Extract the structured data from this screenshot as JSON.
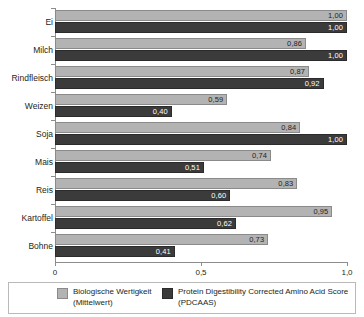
{
  "chart_data": {
    "type": "bar",
    "orientation": "horizontal",
    "title": "",
    "xlabel": "",
    "ylabel": "",
    "xlim": [
      0,
      1.0
    ],
    "grid": false,
    "legend_position": "bottom",
    "categories": [
      "Ei",
      "Milch",
      "Rindfleisch",
      "Weizen",
      "Soja",
      "Mais",
      "Reis",
      "Kartoffel",
      "Bohne"
    ],
    "xticks": [
      0,
      0.5,
      1.0
    ],
    "xtick_labels": [
      "0",
      "0,5",
      "1,0"
    ],
    "series": [
      {
        "name": "Biologische Wertigkeit (Mittelwert)",
        "color": "#b3b3b3",
        "values": [
          1.0,
          0.86,
          0.87,
          0.59,
          0.84,
          0.74,
          0.83,
          0.95,
          0.73
        ],
        "labels": [
          "1,00",
          "0,86",
          "0,87",
          "0,59",
          "0,84",
          "0,74",
          "0,83",
          "0,95",
          "0,73"
        ]
      },
      {
        "name": "Protein Digestibility Corrected Amino Acid Score (PDCAAS)",
        "color": "#3b3b3b",
        "values": [
          1.0,
          1.0,
          0.92,
          0.4,
          1.0,
          0.51,
          0.6,
          0.62,
          0.41
        ],
        "labels": [
          "1,00",
          "1,00",
          "0,92",
          "0,40",
          "1,00",
          "0,51",
          "0,60",
          "0,62",
          "0,41"
        ]
      }
    ]
  },
  "legend": {
    "items": [
      {
        "line1": "Biologische Wertigkeit",
        "line2": "(Mittelwert)"
      },
      {
        "line1": "Protein Digestibility Corrected Amino Acid Score",
        "line2": "(PDCAAS)"
      }
    ]
  }
}
